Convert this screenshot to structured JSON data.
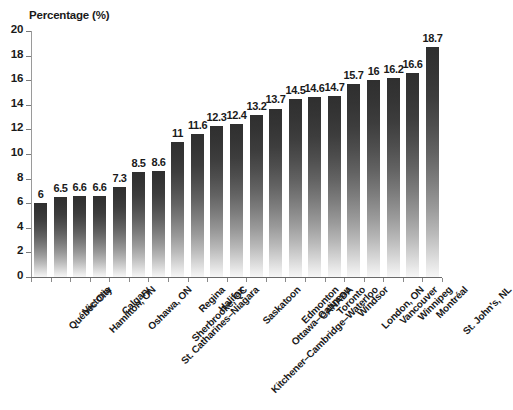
{
  "chart_data": {
    "type": "bar",
    "title": "",
    "xlabel": "",
    "ylabel": "Percentage (%)",
    "ylim": [
      0,
      20
    ],
    "y_ticks": [
      0,
      2,
      4,
      6,
      8,
      10,
      12,
      14,
      16,
      18,
      20
    ],
    "grid": false,
    "legend": "none",
    "orientation": "vertical",
    "categories": [
      "Québec City",
      "Victoria",
      "Hamilton, ON",
      "Calgary",
      "Oshawa, ON",
      "St. Catharines–Niagara",
      "Sherbrooke, QC",
      "Regina",
      "Halifax",
      "Kitchener–Cambridge–Waterloo",
      "Saskatoon",
      "Ottawa–Gatineau",
      "Edmonton",
      "CANADA",
      "Toronto",
      "Windsor",
      "London, ON",
      "Vancouver",
      "Winnipeg",
      "Montréal",
      "St. John's, NL"
    ],
    "values": [
      6,
      6.5,
      6.6,
      6.6,
      7.3,
      8.5,
      8.6,
      11,
      11.6,
      12.3,
      12.4,
      13.2,
      13.7,
      14.5,
      14.6,
      14.7,
      15.7,
      16,
      16.2,
      16.6,
      18.7
    ],
    "value_labels": [
      "6",
      "6.5",
      "6.6",
      "6.6",
      "7.3",
      "8.5",
      "8.6",
      "11",
      "11.6",
      "12.3",
      "12.4",
      "13.2",
      "13.7",
      "14.5",
      "14.6",
      "14.7",
      "15.7",
      "16",
      "16.2",
      "16.6",
      "18.7"
    ],
    "bar_color_top": "#2f2f2f",
    "bar_color_bottom": "#f6f6f6",
    "axis_color": "#6a6a6a"
  },
  "axis": {
    "y_title": "Percentage (%)"
  },
  "footer": {
    "source_note": ""
  }
}
